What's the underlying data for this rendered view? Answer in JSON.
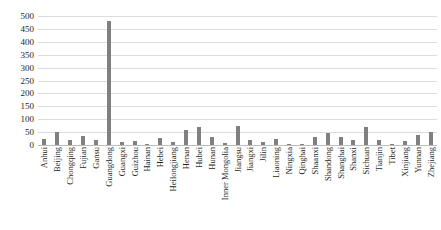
{
  "chart_data": {
    "type": "bar",
    "title": "",
    "subtitle": "",
    "xlabel": "",
    "ylabel": "",
    "ylim": [
      0,
      500
    ],
    "ytick_labels": [
      "500",
      "450",
      "400",
      "350",
      "300",
      "250",
      "200",
      "150",
      "100",
      "50",
      "0"
    ],
    "ytick_values": [
      500,
      450,
      400,
      350,
      300,
      250,
      200,
      150,
      100,
      50,
      0
    ],
    "grid": true,
    "legend": false,
    "bar_color": "#808080",
    "gridline_color": "#dcdcdc",
    "categories": [
      "Anhui",
      "Beijing",
      "Chongqing",
      "Fujian",
      "Gansu",
      "Guangdong",
      "Guangxi",
      "Guizhou",
      "Hainan",
      "Hebei",
      "Heilongjiang",
      "Henan",
      "Hubei",
      "Hunan",
      "Inner Mongolia",
      "Jiangsu",
      "Jiangxi",
      "Jilin",
      "Liaoning",
      "Ningxia",
      "Qinghai",
      "Shaanxi",
      "Shandong",
      "Shanghai",
      "Shanxi",
      "Sichuan",
      "Tianjin",
      "Tibet",
      "Xinjiang",
      "Yunnan",
      "Zhejiang"
    ],
    "values": [
      22,
      52,
      20,
      35,
      18,
      480,
      10,
      14,
      5,
      26,
      12,
      60,
      70,
      30,
      8,
      75,
      20,
      10,
      22,
      3,
      3,
      30,
      45,
      32,
      18,
      70,
      20,
      2,
      15,
      40,
      50
    ]
  }
}
